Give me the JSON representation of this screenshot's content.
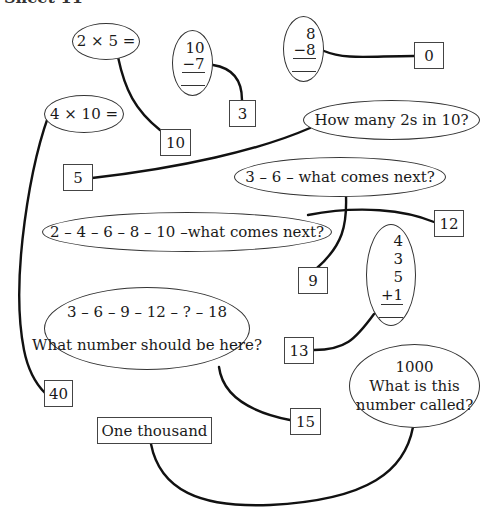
{
  "header": {
    "title": "Sheet 11"
  },
  "questions": [
    {
      "id": "q1",
      "text": "2 × 5 ="
    },
    {
      "id": "q2",
      "lines": [
        "10",
        "−7"
      ],
      "operation": "subtract"
    },
    {
      "id": "q3",
      "lines": [
        "8",
        "−8"
      ],
      "operation": "subtract"
    },
    {
      "id": "q4",
      "text": "4 × 10 ="
    },
    {
      "id": "q5",
      "text": "How many 2s in 10?"
    },
    {
      "id": "q6",
      "text": "3 – 6 – what comes next?"
    },
    {
      "id": "q7",
      "text": "2 – 4 – 6 – 8 – 10 –what comes next?"
    },
    {
      "id": "q8",
      "lines": [
        "4",
        "3",
        "5",
        "+1"
      ],
      "operation": "add"
    },
    {
      "id": "q9",
      "line1": "3 – 6 – 9 – 12 – ? – 18",
      "line2": "What number should be here?"
    },
    {
      "id": "q10",
      "line1": "1000",
      "line2": "What is this",
      "line3": "number called?"
    }
  ],
  "answers": [
    {
      "id": "a10",
      "text": "10",
      "links_to": "q1"
    },
    {
      "id": "a3",
      "text": "3",
      "links_to": "q2"
    },
    {
      "id": "a0",
      "text": "0",
      "links_to": "q3"
    },
    {
      "id": "a5",
      "text": "5",
      "links_to": "q5"
    },
    {
      "id": "a12",
      "text": "12",
      "links_to": "q7"
    },
    {
      "id": "a9",
      "text": "9",
      "links_to": "q6"
    },
    {
      "id": "a13",
      "text": "13",
      "links_to": "q8"
    },
    {
      "id": "a40",
      "text": "40",
      "links_to": "q4"
    },
    {
      "id": "a15",
      "text": "15",
      "links_to": "q9"
    },
    {
      "id": "aOne",
      "text": "One thousand",
      "links_to": "q10"
    }
  ],
  "colors": {
    "line": "#111111",
    "border": "#333333",
    "background": "#ffffff"
  }
}
